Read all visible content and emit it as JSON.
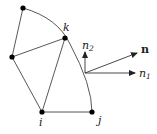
{
  "diagram": {
    "type": "finite-element-boundary-normal",
    "nodes": [
      {
        "id": "top",
        "x": 23,
        "y": 8,
        "label": ""
      },
      {
        "id": "k",
        "x": 65,
        "y": 38,
        "label": "k"
      },
      {
        "id": "left",
        "x": 12,
        "y": 57,
        "label": ""
      },
      {
        "id": "i",
        "x": 42,
        "y": 112,
        "label": "i"
      },
      {
        "id": "j",
        "x": 92,
        "y": 112,
        "label": "j"
      }
    ],
    "edges": [
      [
        "top",
        "left"
      ],
      [
        "left",
        "k"
      ],
      [
        "left",
        "i"
      ],
      [
        "k",
        "i"
      ],
      [
        "i",
        "j"
      ]
    ],
    "curved_boundary": "top → k → j (arc)",
    "vectors": [
      {
        "name": "n2",
        "label": "n",
        "sub": "2",
        "direction": "up"
      },
      {
        "name": "n1",
        "label": "n",
        "sub": "1",
        "direction": "right"
      },
      {
        "name": "n",
        "label": "n",
        "direction": "up-right",
        "bold": true
      }
    ],
    "colors": {
      "line": "#333333",
      "node": "#000000",
      "text": "#222222"
    }
  }
}
